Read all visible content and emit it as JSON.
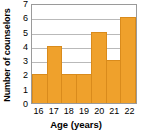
{
  "chart_data": {
    "type": "bar",
    "title": "",
    "subtitle": "",
    "xlabel": "Age (years)",
    "ylabel": "Number of counselors",
    "categories": [
      "16",
      "17",
      "18",
      "19",
      "20",
      "21",
      "22"
    ],
    "values": [
      2,
      4,
      2,
      2,
      5,
      3,
      6
    ],
    "series": [
      {
        "name": "Number of counselors",
        "values": [
          2,
          4,
          2,
          2,
          5,
          3,
          6
        ]
      }
    ],
    "ylim": [
      0,
      7
    ],
    "ytick_labels": [
      "0",
      "1",
      "2",
      "3",
      "4",
      "5",
      "6",
      "7"
    ],
    "ytick_values": [
      0,
      1,
      2,
      3,
      4,
      5,
      6,
      7
    ],
    "xtick_labels": [
      "16",
      "17",
      "18",
      "19",
      "20",
      "21",
      "22"
    ],
    "grid": "horizontal",
    "legend": "none",
    "bar_gap": 0,
    "colors": {
      "bar_fill": "#efa12c",
      "bar_stroke": "#d98b1c",
      "gridline": "#b9b9b9",
      "frame": "#9a9a9a",
      "background": "#ffffff",
      "text": "#000000"
    },
    "annotations": []
  }
}
